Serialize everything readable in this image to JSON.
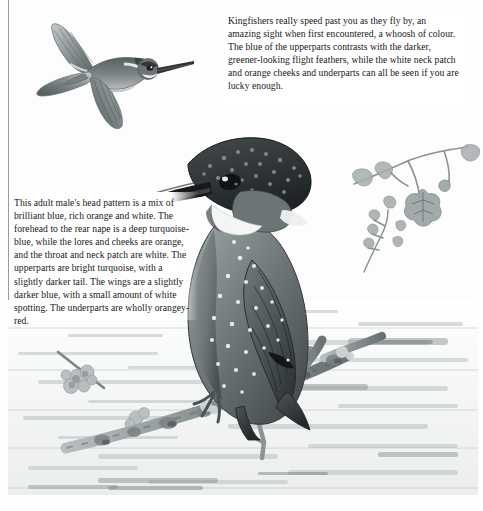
{
  "page": {
    "kind": "illustrated-field-guide-plate",
    "subject": "Kingfisher",
    "palette": {
      "paper": "#fdfdfd",
      "ink": "#171717",
      "rule": "#9a9a9a",
      "wash_light": "#d8dcdd",
      "wash_mid": "#9aa1a3",
      "wash_dark": "#4c5355",
      "wash_darkest": "#2b3032"
    },
    "frame": {
      "left_rule": "vertical-rule",
      "bottom_rule": "horizontal-rule"
    }
  },
  "captions": {
    "top_right": {
      "text": "Kingfishers really speed past you as they fly by, an amazing sight when first encountered, a whoosh of colour. The blue of the upperparts contrasts with the darker, greener-looking flight feathers, while the white neck patch and orange cheeks and underparts can all be seen if you are lucky enough."
    },
    "left": {
      "text": "This adult male's head pattern is a mix of brilliant blue, rich orange and white. The forehead to the rear nape is a deep turquoise-blue, while the lores and cheeks are orange, and the throat and neck patch are white. The upperparts are bright turquoise, with a slightly darker tail. The wings are a slightly darker blue, with a small amount of white spotting. The underparts are wholly orangey-red."
    }
  },
  "illustration": {
    "flying_bird": {
      "label": "kingfisher-in-flight",
      "position": "top-left"
    },
    "perched_bird": {
      "label": "adult-male-kingfisher-perched",
      "position": "centre"
    },
    "branch": {
      "label": "lichen-covered-branch",
      "position": "lower-centre"
    },
    "oak_twig": {
      "label": "oak-leaf-twig",
      "position": "upper-right"
    },
    "water": {
      "label": "water-surface-background",
      "position": "lower-half"
    }
  }
}
